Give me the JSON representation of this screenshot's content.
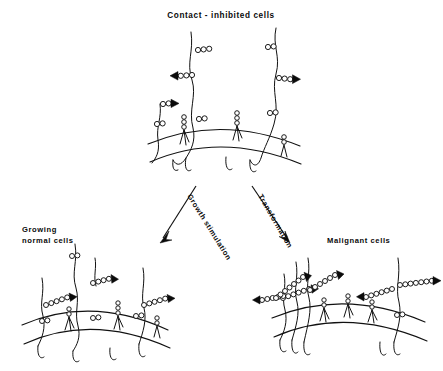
{
  "figure": {
    "kind": "cell-surface-schematic",
    "background_color": "#ffffff",
    "ink_color": "#111111"
  },
  "labels": {
    "title": "Contact - inhibited  cells",
    "left_cell": "Growing",
    "left_cell_2": "normal cells",
    "right_cell": "Malignant  cells",
    "arrow_left": "Growth stimulation",
    "arrow_right": "Transformation"
  },
  "panels": [
    {
      "id": "contact-inhibited",
      "name": "Contact - inhibited  cells",
      "position": "top-center",
      "filament_count": 3,
      "bead_chain_lengths": [
        2,
        3,
        2,
        2,
        3,
        2,
        2
      ],
      "arrowhead_count": 3,
      "membrane_receptors": 4,
      "description": "Few short surface bead chains on long extended filaments"
    },
    {
      "id": "growing-normal",
      "name": "Growing normal cells",
      "position": "bottom-left",
      "filament_count": 4,
      "bead_chain_lengths": [
        2,
        4,
        5,
        2,
        5,
        2,
        2
      ],
      "arrowhead_count": 3,
      "membrane_receptors": 3,
      "description": "Intermediate number of medium bead chains with arrowheads"
    },
    {
      "id": "malignant",
      "name": "Malignant cells",
      "position": "bottom-right",
      "filament_count": 4,
      "bead_chain_lengths": [
        6,
        5,
        7,
        6,
        6,
        7,
        2
      ],
      "arrowhead_count": 6,
      "membrane_receptors": 3,
      "description": "Many long dense bead chains each ending in a solid arrowhead"
    }
  ],
  "transitions": [
    {
      "id": "growth-stimulation",
      "label": "Growth stimulation",
      "from": "contact-inhibited",
      "to": "growing-normal",
      "direction": "down-left"
    },
    {
      "id": "transformation",
      "label": "Transformation",
      "from": "contact-inhibited",
      "to": "malignant",
      "direction": "down-right"
    }
  ]
}
